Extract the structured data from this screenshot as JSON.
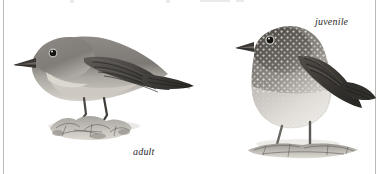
{
  "plate": {
    "kind": "field-guide-illustration-plate",
    "background_color": "#ffffff",
    "width": 392,
    "height": 174,
    "rule_color": "#b9b9b9"
  },
  "captions": {
    "adult": "adult",
    "juvenile": "juvenile"
  },
  "figures": [
    {
      "id": "adult-bird",
      "label": "adult",
      "pose": "perched, horizontal, facing left",
      "plumage": "uniform grey-brown upperparts, plain paler grey-buff underparts, dark wings and tail, dark eye with pale eye-ring, dark pointed bill",
      "perch": "rocky leaf-litter ground mound",
      "ink_dark": "#3a3a3a",
      "ink_mid": "#8a8a8a",
      "ink_light": "#d0cec9"
    },
    {
      "id": "juvenile-bird",
      "label": "juvenile",
      "pose": "standing upright on long legs, facing left",
      "plumage": "dark brown heavily spotted and scaled with buff-white speckling over head, back and breast, whitish belly, dark wings and tail",
      "perch": "flat ground patch",
      "ink_dark": "#3a3a3a",
      "ink_mid": "#8a8a8a",
      "ink_light": "#d0cec9"
    }
  ]
}
